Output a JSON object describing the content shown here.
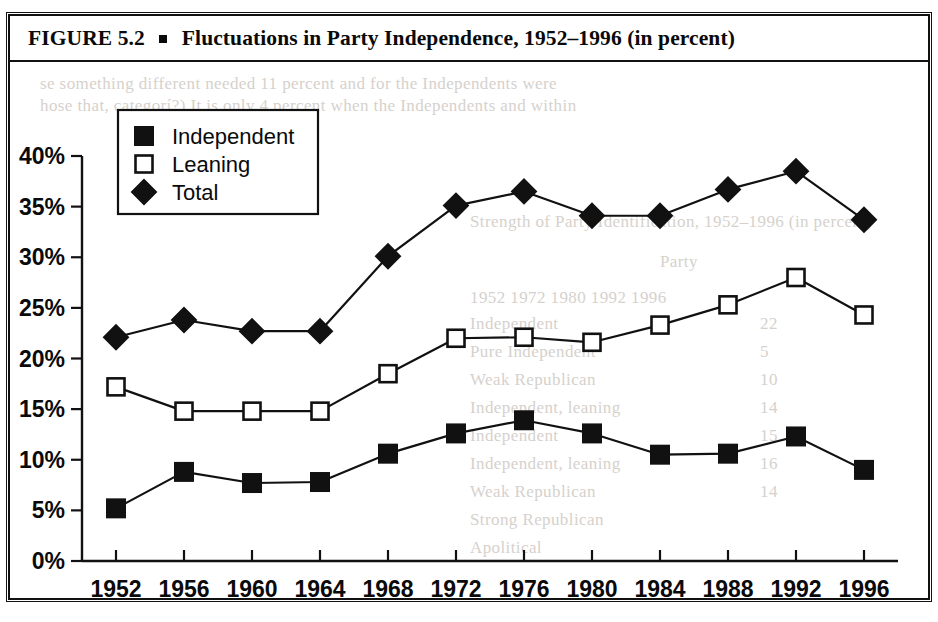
{
  "figure": {
    "caption_prefix": "FIGURE 5.2",
    "caption_text": "Fluctuations in Party Independence, 1952–1996 (in percent)",
    "bullet_icon": "square-bullet"
  },
  "legend": {
    "position": "top-left-inside",
    "entries": [
      {
        "label": "Independent",
        "marker": "filled-square"
      },
      {
        "label": "Leaning",
        "marker": "open-square"
      },
      {
        "label": "Total",
        "marker": "filled-diamond"
      }
    ]
  },
  "axes": {
    "y_ticks": [
      "0%",
      "5%",
      "10%",
      "15%",
      "20%",
      "25%",
      "30%",
      "35%",
      "40%"
    ],
    "x_ticks": [
      "1952",
      "1956",
      "1960",
      "1964",
      "1968",
      "1972",
      "1976",
      "1980",
      "1984",
      "1988",
      "1992",
      "1996"
    ]
  },
  "colors": {
    "ink": "#111111",
    "paper": "#ffffff"
  },
  "bleed_through": [
    {
      "text": "se something different needed 11 percent and for the Independents were",
      "x": 40,
      "y": 74
    },
    {
      "text": "hose that, categorí?) It is only 4 percent when the Independents and within",
      "x": 40,
      "y": 96
    },
    {
      "text": "Strength of Party Identification, 1952–1996 (in percent)",
      "x": 470,
      "y": 212
    },
    {
      "text": "Party",
      "x": 660,
      "y": 252
    },
    {
      "text": "1952     1972     1980     1992     1996",
      "x": 470,
      "y": 288
    },
    {
      "text": "Independent",
      "x": 470,
      "y": 314
    },
    {
      "text": "Pure Independent",
      "x": 470,
      "y": 342
    },
    {
      "text": "Weak Republican",
      "x": 470,
      "y": 370
    },
    {
      "text": "Independent, leaning",
      "x": 470,
      "y": 398
    },
    {
      "text": "Independent",
      "x": 470,
      "y": 426
    },
    {
      "text": "Independent, leaning",
      "x": 470,
      "y": 454
    },
    {
      "text": "Weak Republican",
      "x": 470,
      "y": 482
    },
    {
      "text": "Strong Republican",
      "x": 470,
      "y": 510
    },
    {
      "text": "Apolitical",
      "x": 470,
      "y": 538
    },
    {
      "text": "22",
      "x": 760,
      "y": 314
    },
    {
      "text": "5",
      "x": 760,
      "y": 342
    },
    {
      "text": "10",
      "x": 760,
      "y": 370
    },
    {
      "text": "14",
      "x": 760,
      "y": 398
    },
    {
      "text": "15",
      "x": 760,
      "y": 426
    },
    {
      "text": "16",
      "x": 760,
      "y": 454
    },
    {
      "text": "14",
      "x": 760,
      "y": 482
    }
  ],
  "chart_data": {
    "type": "line",
    "title": "Fluctuations in Party Independence, 1952–1996 (in percent)",
    "xlabel": "",
    "ylabel": "",
    "ylim": [
      0,
      40
    ],
    "y_tick_step": 5,
    "y_tick_format": "percent",
    "grid": false,
    "legend_position": "upper left",
    "categories": [
      "1952",
      "1956",
      "1960",
      "1964",
      "1968",
      "1972",
      "1976",
      "1980",
      "1984",
      "1988",
      "1992",
      "1996"
    ],
    "series": [
      {
        "name": "Independent",
        "marker": "filled-square",
        "values": [
          5.2,
          8.8,
          7.7,
          7.8,
          10.6,
          12.6,
          13.9,
          12.6,
          10.5,
          10.6,
          12.3,
          9.0
        ]
      },
      {
        "name": "Leaning",
        "marker": "open-square",
        "values": [
          17.2,
          14.8,
          14.8,
          14.8,
          18.5,
          22.0,
          22.1,
          21.6,
          23.3,
          25.3,
          28.0,
          24.3
        ]
      },
      {
        "name": "Total",
        "marker": "filled-diamond",
        "values": [
          22.1,
          23.8,
          22.7,
          22.7,
          30.1,
          35.1,
          36.5,
          34.1,
          34.1,
          36.7,
          38.5,
          33.7
        ]
      }
    ]
  }
}
